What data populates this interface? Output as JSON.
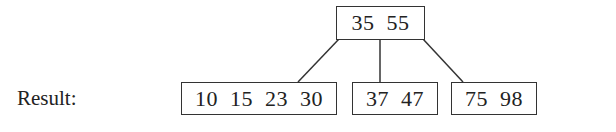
{
  "label": "Result:",
  "tree": {
    "root": {
      "keys": "35 55"
    },
    "children": [
      {
        "keys": "10 15 23 30"
      },
      {
        "keys": "37 47"
      },
      {
        "keys": "75 98"
      }
    ]
  }
}
